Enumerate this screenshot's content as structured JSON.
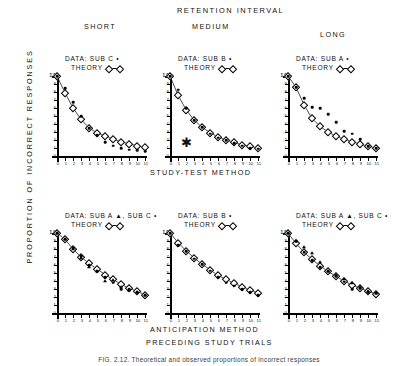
{
  "figure": {
    "main_header": "RETENTION  INTERVAL",
    "column_headers": [
      "SHORT",
      "MEDIUM",
      "LONG"
    ],
    "row_label_middle": "STUDY-TEST  METHOD",
    "row_label_bottom": "ANTICIPATION  METHOD",
    "x_title": "PRECEDING   STUDY   TRIALS",
    "y_title": "PROPORTION  OF  INCORRECT  RESPONSES",
    "caption": "FIG. 2.12.  Theoretical and observed proportions of incorrect responses",
    "theory_label": "THEORY",
    "asterisk": "✱"
  },
  "axes": {
    "y_ticks": [
      "1.0",
      ".9",
      ".8",
      ".7",
      ".6",
      ".5",
      ".4",
      ".3",
      ".2",
      ".1",
      "0"
    ],
    "y_values": [
      1.0,
      0.9,
      0.8,
      0.7,
      0.6,
      0.5,
      0.4,
      0.3,
      0.2,
      0.1,
      0.0
    ],
    "x_ticks": [
      "0",
      "1",
      "2",
      "3",
      "4",
      "5",
      "6",
      "7",
      "8",
      "9",
      "10",
      "11"
    ],
    "x_values": [
      0,
      1,
      2,
      3,
      4,
      5,
      6,
      7,
      8,
      9,
      10,
      11
    ],
    "ylim": [
      0,
      1.0
    ],
    "xlim": [
      0,
      11
    ]
  },
  "chart_data": [
    {
      "type": "line",
      "panel_id": "short-study-test",
      "title": "SHORT",
      "row": "STUDY-TEST  METHOD",
      "legend_data": "DATA:  SUB C •",
      "legend_theory": "THEORY",
      "xlabel": "PRECEDING   STUDY   TRIALS",
      "ylabel": "PROPORTION  OF  INCORRECT  RESPONSES",
      "xlim": [
        0,
        11
      ],
      "ylim": [
        0,
        1.0
      ],
      "x": [
        0,
        1,
        2,
        3,
        4,
        5,
        6,
        7,
        8,
        9,
        10,
        11
      ],
      "series": [
        {
          "name": "THEORY",
          "marker": "diamond",
          "line": true,
          "values": [
            1.0,
            0.79,
            0.6,
            0.46,
            0.35,
            0.29,
            0.25,
            0.21,
            0.18,
            0.15,
            0.13,
            0.11
          ]
        },
        {
          "name": "DATA: SUB C",
          "marker": "dot",
          "line": false,
          "values": [
            1.0,
            0.85,
            0.67,
            0.5,
            0.35,
            0.26,
            0.17,
            0.13,
            0.1,
            0.08,
            0.07,
            0.06
          ]
        }
      ]
    },
    {
      "type": "line",
      "panel_id": "medium-study-test",
      "title": "MEDIUM",
      "row": "STUDY-TEST  METHOD",
      "legend_data": "DATA:  SUB B •",
      "legend_theory": "THEORY",
      "xlim": [
        0,
        11
      ],
      "ylim": [
        0,
        1.0
      ],
      "annotation": "✱",
      "annotation_x": 2,
      "annotation_y": 0.17,
      "x": [
        0,
        1,
        2,
        3,
        4,
        5,
        6,
        7,
        8,
        9,
        10,
        11
      ],
      "series": [
        {
          "name": "THEORY",
          "marker": "diamond",
          "line": true,
          "values": [
            1.0,
            0.76,
            0.58,
            0.45,
            0.36,
            0.29,
            0.24,
            0.2,
            0.17,
            0.14,
            0.12,
            0.1
          ]
        },
        {
          "name": "DATA: SUB B",
          "marker": "dot",
          "line": false,
          "values": [
            1.0,
            0.83,
            0.6,
            0.45,
            0.36,
            0.28,
            0.23,
            0.2,
            0.16,
            0.13,
            0.1,
            0.09
          ]
        }
      ]
    },
    {
      "type": "line",
      "panel_id": "long-study-test",
      "title": "LONG",
      "row": "STUDY-TEST  METHOD",
      "legend_data": "DATA:  SUB A •",
      "legend_theory": "THEORY",
      "xlim": [
        0,
        11
      ],
      "ylim": [
        0,
        1.0
      ],
      "x": [
        0,
        1,
        2,
        3,
        4,
        5,
        6,
        7,
        8,
        9,
        10,
        11
      ],
      "series": [
        {
          "name": "THEORY",
          "marker": "diamond",
          "line": true,
          "values": [
            1.0,
            0.86,
            0.64,
            0.47,
            0.37,
            0.3,
            0.25,
            0.21,
            0.18,
            0.15,
            0.12,
            0.1
          ]
        },
        {
          "name": "DATA: SUB A",
          "marker": "dot",
          "line": false,
          "values": [
            1.0,
            0.86,
            0.72,
            0.61,
            0.6,
            0.52,
            0.42,
            0.31,
            0.28,
            0.21,
            0.12,
            0.1
          ]
        }
      ]
    },
    {
      "type": "line",
      "panel_id": "short-anticipation",
      "title": "SHORT",
      "row": "ANTICIPATION  METHOD",
      "legend_data": "DATA:  SUB A ▲,  SUB C •",
      "legend_theory": "THEORY",
      "xlim": [
        0,
        11
      ],
      "ylim": [
        0,
        1.0
      ],
      "x": [
        0,
        1,
        2,
        3,
        4,
        5,
        6,
        7,
        8,
        9,
        10,
        11
      ],
      "series": [
        {
          "name": "THEORY",
          "marker": "diamond",
          "line": true,
          "values": [
            1.0,
            0.92,
            0.8,
            0.7,
            0.62,
            0.55,
            0.48,
            0.42,
            0.36,
            0.31,
            0.27,
            0.23
          ]
        },
        {
          "name": "DATA: SUB A",
          "marker": "triangle",
          "line": false,
          "values": [
            1.0,
            0.93,
            0.8,
            0.69,
            0.58,
            0.52,
            0.4,
            0.41,
            0.33,
            0.29,
            0.26,
            0.22
          ]
        },
        {
          "name": "DATA: SUB C",
          "marker": "dot",
          "line": false,
          "values": [
            1.0,
            0.92,
            0.81,
            0.71,
            0.6,
            0.53,
            0.45,
            0.38,
            0.3,
            0.3,
            0.26,
            0.22
          ]
        }
      ]
    },
    {
      "type": "line",
      "panel_id": "medium-anticipation",
      "title": "MEDIUM",
      "row": "ANTICIPATION  METHOD",
      "legend_data": "DATA:  SUB B •",
      "legend_theory": "THEORY",
      "xlim": [
        0,
        11
      ],
      "ylim": [
        0,
        1.0
      ],
      "x": [
        0,
        1,
        2,
        3,
        4,
        5,
        6,
        7,
        8,
        9,
        10,
        11
      ],
      "series": [
        {
          "name": "THEORY",
          "marker": "diamond",
          "line": true,
          "values": [
            1.0,
            0.88,
            0.78,
            0.69,
            0.61,
            0.54,
            0.47,
            0.42,
            0.37,
            0.33,
            0.29,
            0.25
          ]
        },
        {
          "name": "DATA: SUB B",
          "marker": "dot",
          "line": false,
          "values": [
            1.0,
            0.85,
            0.77,
            0.68,
            0.61,
            0.53,
            0.45,
            0.38,
            0.34,
            0.3,
            0.26,
            0.22
          ]
        }
      ]
    },
    {
      "type": "line",
      "panel_id": "long-anticipation",
      "title": "LONG",
      "row": "ANTICIPATION  METHOD",
      "legend_data": "DATA:  SUB A ▲,  SUB C •",
      "legend_theory": "THEORY",
      "xlim": [
        0,
        11
      ],
      "ylim": [
        0,
        1.0
      ],
      "x": [
        0,
        1,
        2,
        3,
        4,
        5,
        6,
        7,
        8,
        9,
        10,
        11
      ],
      "series": [
        {
          "name": "THEORY",
          "marker": "diamond",
          "line": true,
          "values": [
            1.0,
            0.87,
            0.76,
            0.67,
            0.59,
            0.52,
            0.46,
            0.4,
            0.35,
            0.31,
            0.27,
            0.24
          ]
        },
        {
          "name": "DATA: SUB A",
          "marker": "triangle",
          "line": false,
          "values": [
            1.0,
            0.9,
            0.82,
            0.75,
            0.64,
            0.53,
            0.47,
            0.42,
            0.37,
            0.33,
            0.28,
            0.25
          ]
        },
        {
          "name": "DATA: SUB C",
          "marker": "dot",
          "line": false,
          "values": [
            1.0,
            0.9,
            0.76,
            0.66,
            0.57,
            0.52,
            0.46,
            0.39,
            0.3,
            0.31,
            0.26,
            0.25
          ]
        }
      ]
    }
  ]
}
